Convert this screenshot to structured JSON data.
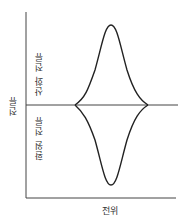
{
  "diagram": {
    "title": "",
    "y_axis_label": "전류",
    "x_axis_label": "전위",
    "upper_region_label": "산화 전류",
    "lower_region_label": "환원 전류",
    "colors": {
      "line": "#222222",
      "axis": "#444444",
      "text": "#333333"
    }
  }
}
